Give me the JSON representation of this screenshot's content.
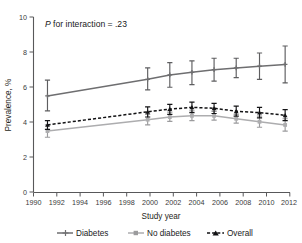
{
  "figure": {
    "annotation_prefix": "P",
    "annotation_rest": " for interaction = .23"
  },
  "chart_data": {
    "type": "line",
    "title": "",
    "xlabel": "Study year",
    "ylabel": "Prevalence, %",
    "xlim": [
      1990,
      2012
    ],
    "ylim": [
      0,
      10
    ],
    "xticks": [
      1990,
      1992,
      1994,
      1996,
      1998,
      2000,
      2002,
      2004,
      2006,
      2008,
      2010,
      2012
    ],
    "yticks": [
      0,
      2,
      4,
      6,
      8,
      10
    ],
    "grid": false,
    "legend_position": "below",
    "x": [
      1991.2,
      1999.8,
      2001.7,
      2003.6,
      2005.5,
      2007.4,
      2009.4,
      2011.6
    ],
    "series": [
      {
        "name": "Diabetes",
        "color": "#6e6e70",
        "style": "solid",
        "marker": "plus",
        "values": [
          5.5,
          6.45,
          6.7,
          6.85,
          7.0,
          7.1,
          7.2,
          7.3
        ],
        "err_low": [
          4.65,
          5.85,
          6.0,
          6.15,
          6.35,
          6.55,
          6.45,
          6.25
        ],
        "err_high": [
          6.4,
          7.1,
          7.4,
          7.5,
          7.65,
          7.65,
          7.95,
          8.35
        ]
      },
      {
        "name": "No diabetes",
        "color": "#adadaf",
        "style": "solid",
        "marker": "square",
        "values": [
          3.5,
          4.15,
          4.3,
          4.37,
          4.37,
          4.2,
          4.03,
          3.85
        ],
        "err_low": [
          3.15,
          3.85,
          4.05,
          4.1,
          4.12,
          3.95,
          3.72,
          3.5
        ],
        "err_high": [
          3.85,
          4.45,
          4.58,
          4.65,
          4.62,
          4.45,
          4.35,
          4.2
        ]
      },
      {
        "name": "Overall",
        "color": "#121214",
        "style": "dashed",
        "marker": "triangle",
        "values": [
          3.85,
          4.6,
          4.75,
          4.85,
          4.8,
          4.63,
          4.55,
          4.4
        ],
        "err_low": [
          3.6,
          4.3,
          4.45,
          4.55,
          4.5,
          4.35,
          4.25,
          4.1
        ],
        "err_high": [
          4.1,
          4.88,
          5.02,
          5.15,
          5.08,
          4.92,
          4.85,
          4.72
        ]
      }
    ]
  },
  "legend": {
    "items": [
      {
        "label": "Diabetes"
      },
      {
        "label": "No diabetes"
      },
      {
        "label": "Overall"
      }
    ]
  }
}
